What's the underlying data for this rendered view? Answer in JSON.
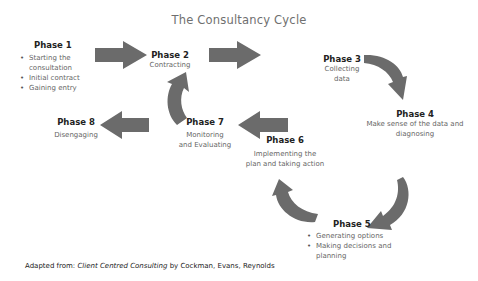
{
  "title": "The Consultancy Cycle",
  "arrow_color": "#6b6b6b",
  "phases": [
    {
      "label": "Phase 1",
      "items": [
        "Starting the consultation",
        "Initial contract",
        "Gaining entry"
      ]
    },
    {
      "label": "Phase 2",
      "desc": "Contracting"
    },
    {
      "label": "Phase 3",
      "desc_lines": [
        "Collecting",
        "data"
      ]
    },
    {
      "label": "Phase 4",
      "desc_lines": [
        "Make sense of the data and",
        "diagnosing"
      ]
    },
    {
      "label": "Phase 5",
      "items": [
        "Generating options",
        "Making decisions and planning"
      ]
    },
    {
      "label": "Phase 6",
      "desc_lines": [
        "Implementing the",
        "plan and taking action"
      ]
    },
    {
      "label": "Phase 7",
      "desc_lines": [
        "Monitoring",
        "and Evaluating"
      ]
    },
    {
      "label": "Phase 8",
      "desc": "Disengaging"
    }
  ],
  "phase1_items": {
    "a1": "Starting the",
    "a2": "consultation",
    "b": "Initial contract",
    "c": "Gaining entry"
  },
  "phase5_items": {
    "a": "Generating options",
    "b1": "Making decisions and",
    "b2": "planning"
  },
  "footer": {
    "prefix": "Adapted from:",
    "book": "Client Centred Consulting",
    "suffix": "by Cockman, Evans, Reynolds"
  }
}
